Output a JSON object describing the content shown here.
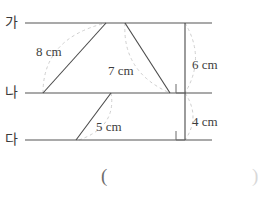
{
  "figure": {
    "parallel_lines": [
      {
        "id": "ga",
        "label": "가",
        "y": 23,
        "x_start": 25,
        "x_end": 212
      },
      {
        "id": "na",
        "label": "나",
        "y": 93,
        "x_start": 25,
        "x_end": 212
      },
      {
        "id": "da",
        "label": "다",
        "y": 140,
        "x_start": 25,
        "x_end": 212
      }
    ],
    "segments": [
      {
        "id": "seg-8cm",
        "label": "8 cm",
        "x1": 43,
        "y1": 93,
        "x2": 106,
        "y2": 23
      },
      {
        "id": "seg-top-right",
        "label": "",
        "x1": 106,
        "y1": 23,
        "x2": 170,
        "y2": 93
      },
      {
        "id": "seg-7cm",
        "label": "7 cm",
        "x1": 125,
        "y1": 23,
        "x2": 170,
        "y2": 93
      },
      {
        "id": "seg-5cm",
        "label": "5 cm",
        "x1": 76,
        "y1": 140,
        "x2": 111,
        "y2": 93
      },
      {
        "id": "seg-vertical",
        "label": "",
        "x1": 185,
        "y1": 23,
        "x2": 185,
        "y2": 140
      }
    ],
    "dimension_labels": [
      {
        "id": "dim-8cm",
        "text": "8 cm",
        "x": 36,
        "y": 45
      },
      {
        "id": "dim-7cm",
        "text": "7 cm",
        "x": 108,
        "y": 64
      },
      {
        "id": "dim-5cm",
        "text": "5 cm",
        "x": 96,
        "y": 120
      },
      {
        "id": "dim-6cm",
        "text": "6 cm",
        "x": 192,
        "y": 58
      },
      {
        "id": "dim-4cm",
        "text": "4 cm",
        "x": 192,
        "y": 115
      }
    ],
    "right_angle_marks": [
      {
        "id": "right-angle-na",
        "x": 176,
        "y": 84
      },
      {
        "id": "right-angle-da",
        "x": 176,
        "y": 131
      }
    ],
    "answer_field": {
      "open_paren": "(",
      "close_paren": ")",
      "open_x": 101,
      "close_x": 252,
      "y": 166
    },
    "colors": {
      "line": "#555555",
      "guide": "#c9c9c9",
      "text": "#333333",
      "background": "#ffffff"
    }
  }
}
